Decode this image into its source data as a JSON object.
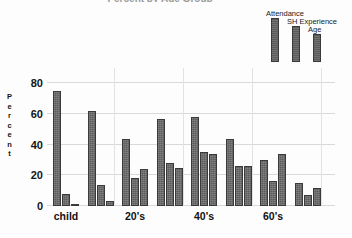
{
  "chart_data": {
    "type": "bar",
    "title": "Percent by Age Group",
    "xlabel": "",
    "ylabel": "Percent",
    "ylim": [
      0,
      90
    ],
    "yticks": [
      0,
      20,
      40,
      60,
      80
    ],
    "ytick_labels": [
      "0",
      "20",
      "40",
      "60",
      "80"
    ],
    "grid": true,
    "legend_position": "top-right",
    "categories": [
      "child",
      "",
      "20's",
      "",
      "40's",
      "",
      "60's",
      ""
    ],
    "visible_xtick_labels": [
      "child",
      "20's",
      "40's",
      "60's"
    ],
    "series": [
      {
        "name": "Attendance",
        "color": "#5c5c5c",
        "values": [
          75,
          62,
          44,
          57,
          58,
          44,
          30,
          15
        ]
      },
      {
        "name": "SH Experience",
        "color": "#5c5c5c",
        "values": [
          8,
          14,
          18,
          28,
          35,
          26,
          16,
          7
        ]
      },
      {
        "name": "Age",
        "color": "#5c5c5c",
        "values": [
          1,
          3,
          24,
          25,
          34,
          26,
          34,
          12
        ]
      }
    ]
  },
  "legend": {
    "items": [
      {
        "label": "Attendance"
      },
      {
        "label": "SH Experience"
      },
      {
        "label": "Age"
      }
    ]
  },
  "axis": {
    "y_title_letters": [
      "P",
      "e",
      "r",
      "c",
      "e",
      "n",
      "t"
    ]
  }
}
